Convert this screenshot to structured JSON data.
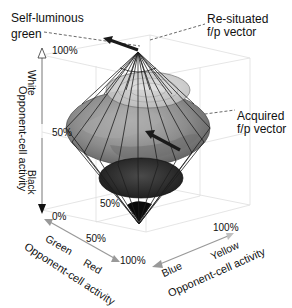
{
  "callouts": {
    "self_luminous": [
      "Self-luminous",
      "green"
    ],
    "resituated": [
      "Re-situated",
      "f/p vector"
    ],
    "acquired": [
      "Acquired",
      "f/p vector"
    ]
  },
  "vertical_axis": {
    "title": "Opponent-cell activity",
    "upper_label": "White",
    "lower_label": "Black",
    "ticks": [
      "100%",
      "50%",
      "0%"
    ]
  },
  "red_green_axis": {
    "title": "Opponent-cell activity",
    "labels": [
      "Green",
      "Red"
    ],
    "ticks": [
      "50%",
      "100%"
    ]
  },
  "blue_yellow_axis": {
    "title": "Opponent-cell activity",
    "labels": [
      "Blue",
      "Yellow"
    ],
    "ticks": [
      "50%",
      "100%"
    ]
  },
  "colors": {
    "axis_gray": "#9a9a9a",
    "grid": "#dcdcdc",
    "cone_wire": "#222222",
    "upper_disk": "#c4c4c4",
    "middle_disk": "#8a8a8a",
    "lower_disk": "#3a3a3a",
    "apex_black": "#0a0a0a",
    "vector": "#1a1a1a"
  }
}
